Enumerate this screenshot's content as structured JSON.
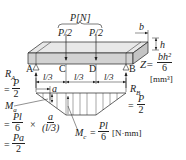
{
  "diagram": {
    "load": {
      "total": "P[N]",
      "left": "P/2",
      "right": "P/2"
    },
    "section": {
      "b_label": "b",
      "h_label": "h",
      "Z_label": "Z=",
      "Z_num": "bh²",
      "Z_den": "6",
      "Z_unit": "[mm³]"
    },
    "points": {
      "A": "A",
      "B": "B",
      "C": "C",
      "D": "D"
    },
    "spans": [
      "l/3",
      "l/3",
      "l/3"
    ],
    "reaction_left": {
      "label": "R",
      "sub": "A",
      "eq": "=",
      "num": "P",
      "den": "2"
    },
    "reaction_right": {
      "label": "R",
      "sub": "B",
      "eq": "=",
      "num": "P",
      "den": "2"
    },
    "a_label": "a",
    "moment_a": {
      "label": "M",
      "sub": "a",
      "line1_eq": "=",
      "line1_num": "Pl",
      "line1_den": "6",
      "times": "×",
      "frac2_num": "a",
      "frac2_den": "(l/3)",
      "line2_eq": "=",
      "line2_num": "Pa",
      "line2_den": "2"
    },
    "moment_c": {
      "label": "M",
      "sub": "c",
      "eq": "=",
      "num": "Pl",
      "den": "6",
      "unit": "[N·mm]"
    },
    "colors": {
      "beam_fill": "#d4d4d4",
      "beam_top": "#e6e6e6",
      "line": "#222222"
    }
  }
}
